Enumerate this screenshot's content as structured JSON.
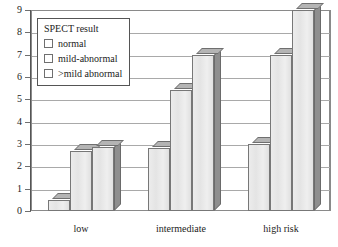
{
  "chart_data": {
    "type": "bar",
    "title": "",
    "xlabel": "",
    "ylabel": "",
    "categories": [
      "low",
      "intermediate",
      "high risk"
    ],
    "ylim": [
      0,
      9
    ],
    "yticks": [
      0,
      1,
      2,
      3,
      4,
      5,
      6,
      7,
      8,
      9
    ],
    "grid": true,
    "legend_position": "top-left-inside",
    "legend_title": "SPECT result",
    "series": [
      {
        "name": "normal",
        "values": [
          0.5,
          2.8,
          3.0
        ]
      },
      {
        "name": "mild-abnormal",
        "values": [
          2.7,
          5.4,
          7.0
        ]
      },
      {
        "name": ">mild abnormal",
        "values": [
          2.85,
          7.0,
          9.0
        ]
      }
    ]
  },
  "colors": {
    "bar_face": "#e7e7e7",
    "bar_side": "#8e8e8e",
    "bar_top": "#b4b4b4",
    "gridline": "#a9a9a9",
    "axis": "#555555",
    "text": "#1c1c1c",
    "plot_background": "#ffffff"
  }
}
